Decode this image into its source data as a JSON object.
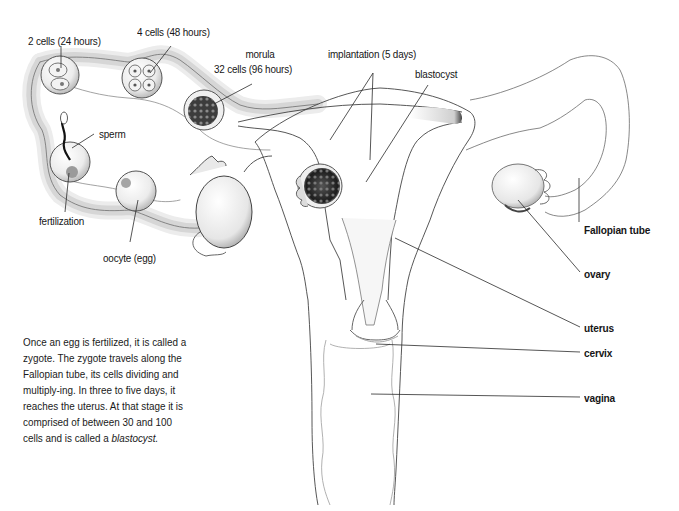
{
  "diagram": {
    "type": "anatomical illustration",
    "stage_labels": [
      {
        "id": "two-cells",
        "text": "2 cells (24 hours)"
      },
      {
        "id": "four-cells",
        "text": "4 cells (48 hours)"
      },
      {
        "id": "morula",
        "line1": "morula",
        "line2": "32 cells (96 hours)"
      },
      {
        "id": "implantation",
        "text": "implantation (5 days)"
      },
      {
        "id": "blastocyst",
        "text": "blastocyst"
      },
      {
        "id": "sperm",
        "text": "sperm"
      },
      {
        "id": "fertilization",
        "text": "fertilization"
      },
      {
        "id": "oocyte",
        "text": "oocyte (egg)"
      }
    ],
    "anatomy_labels": [
      {
        "id": "fallopian-tube",
        "text": "Fallopian tube"
      },
      {
        "id": "ovary",
        "text": "ovary"
      },
      {
        "id": "uterus",
        "text": "uterus"
      },
      {
        "id": "cervix",
        "text": "cervix"
      },
      {
        "id": "vagina",
        "text": "vagina"
      }
    ],
    "caption": {
      "text": "Once an egg is fertilized, it is called a zygote. The zygote travels along the Fallopian tube, its cells dividing and multiply-ing. In three to five days, it reaches the uterus. At that stage it is comprised of between 30 and 100 cells and is called a",
      "emphasis": "blastocyst."
    },
    "colors": {
      "background": "#ffffff",
      "line": "#3a3a3a",
      "shade": "#9a9a9a",
      "text": "#161616"
    }
  }
}
